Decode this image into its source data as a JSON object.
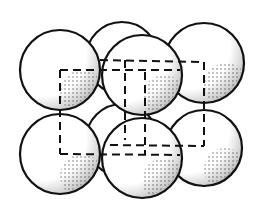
{
  "diagram": {
    "type": "crystal-unit-cell-sphere-packing",
    "stroke_color": "#111111",
    "background": "#ffffff",
    "spheres": [
      {
        "id": "back-top-middle",
        "cx": 122,
        "cy": 58,
        "r": 36,
        "layer": "back"
      },
      {
        "id": "back-bottom-middle",
        "cx": 122,
        "cy": 140,
        "r": 36,
        "layer": "back"
      },
      {
        "id": "top-left",
        "cx": 60,
        "cy": 70,
        "r": 40,
        "layer": "front"
      },
      {
        "id": "top-right",
        "cx": 204,
        "cy": 63,
        "r": 40,
        "layer": "front"
      },
      {
        "id": "bottom-left",
        "cx": 60,
        "cy": 154,
        "r": 40,
        "layer": "front"
      },
      {
        "id": "bottom-right",
        "cx": 204,
        "cy": 148,
        "r": 38,
        "layer": "front"
      },
      {
        "id": "top-center",
        "cx": 142,
        "cy": 75,
        "r": 40,
        "layer": "front"
      },
      {
        "id": "bottom-center",
        "cx": 142,
        "cy": 158,
        "r": 40,
        "layer": "front"
      }
    ],
    "cube_edges": [
      {
        "x1": 60,
        "y1": 70,
        "x2": 180,
        "y2": 70
      },
      {
        "x1": 100,
        "y1": 60,
        "x2": 204,
        "y2": 62
      },
      {
        "x1": 60,
        "y1": 70,
        "x2": 60,
        "y2": 154
      },
      {
        "x1": 204,
        "y1": 62,
        "x2": 204,
        "y2": 146
      },
      {
        "x1": 60,
        "y1": 154,
        "x2": 180,
        "y2": 155
      },
      {
        "x1": 110,
        "y1": 145,
        "x2": 204,
        "y2": 146
      },
      {
        "x1": 125,
        "y1": 60,
        "x2": 125,
        "y2": 140
      },
      {
        "x1": 145,
        "y1": 72,
        "x2": 145,
        "y2": 155
      }
    ],
    "label": "Unit cell of close-packed spheres"
  }
}
